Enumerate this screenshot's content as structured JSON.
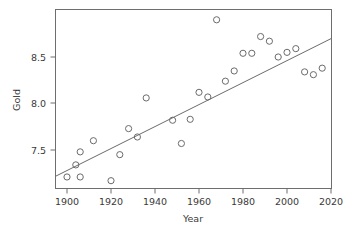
{
  "chart_data": {
    "type": "scatter",
    "title": "",
    "xlabel": "Year",
    "ylabel": "Gold",
    "xlim": [
      1895,
      2022
    ],
    "ylim": [
      7.12,
      8.95
    ],
    "grid": false,
    "legend": "none",
    "xticks": [
      1900,
      1920,
      1940,
      1960,
      1980,
      2000,
      2020
    ],
    "xtick_labels": [
      "1900",
      "1920",
      "1940",
      "1960",
      "1980",
      "2000",
      "2020"
    ],
    "yticks": [
      7.5,
      8.0,
      8.5
    ],
    "ytick_labels": [
      "7.5",
      "8.0",
      "8.5"
    ],
    "marker": "open-circle",
    "marker_color": "#6b6b6b",
    "line_color": "#6b6b6b",
    "points": [
      {
        "x": 1900,
        "y": 7.21
      },
      {
        "x": 1904,
        "y": 7.34
      },
      {
        "x": 1906,
        "y": 7.21
      },
      {
        "x": 1906,
        "y": 7.48
      },
      {
        "x": 1912,
        "y": 7.6
      },
      {
        "x": 1920,
        "y": 7.17
      },
      {
        "x": 1924,
        "y": 7.45
      },
      {
        "x": 1928,
        "y": 7.73
      },
      {
        "x": 1932,
        "y": 7.64
      },
      {
        "x": 1936,
        "y": 8.06
      },
      {
        "x": 1948,
        "y": 7.82
      },
      {
        "x": 1952,
        "y": 7.57
      },
      {
        "x": 1956,
        "y": 7.83
      },
      {
        "x": 1960,
        "y": 8.12
      },
      {
        "x": 1964,
        "y": 8.07
      },
      {
        "x": 1968,
        "y": 8.9
      },
      {
        "x": 1972,
        "y": 8.24
      },
      {
        "x": 1976,
        "y": 8.35
      },
      {
        "x": 1980,
        "y": 8.54
      },
      {
        "x": 1984,
        "y": 8.54
      },
      {
        "x": 1988,
        "y": 8.72
      },
      {
        "x": 1992,
        "y": 8.67
      },
      {
        "x": 1996,
        "y": 8.5
      },
      {
        "x": 2000,
        "y": 8.55
      },
      {
        "x": 2004,
        "y": 8.59
      },
      {
        "x": 2008,
        "y": 8.34
      },
      {
        "x": 2012,
        "y": 8.31
      },
      {
        "x": 2016,
        "y": 8.38
      }
    ],
    "trend_line": {
      "type": "linear-fit",
      "x_start": 1895,
      "y_start": 7.22,
      "x_end": 2022,
      "y_end": 8.7
    }
  }
}
